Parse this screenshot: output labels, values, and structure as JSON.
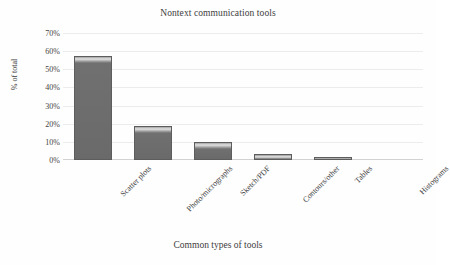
{
  "figure": {
    "title": "Nontext communication tools",
    "xlabel": "Common types of tools",
    "ylabel": "% of total"
  },
  "axis": {
    "yticks": [
      "70%",
      "60%",
      "50%",
      "40%",
      "30%",
      "20%",
      "10%",
      "0%"
    ]
  },
  "chart_data": {
    "type": "bar",
    "title": "Nontext communication tools",
    "xlabel": "Common types of tools",
    "ylabel": "% of total",
    "categories": [
      "Scatter plots",
      "Photo/micrographs",
      "Sketch/PDF",
      "Contours/other",
      "Tables",
      "Histograms"
    ],
    "values": [
      58,
      19,
      10,
      3.5,
      1,
      0
    ],
    "value_unit": "percent",
    "ylim": [
      0,
      70
    ],
    "ytick_step": 10,
    "ytick_labels": [
      "0%",
      "10%",
      "20%",
      "30%",
      "40%",
      "50%",
      "60%",
      "70%"
    ],
    "grid": "horizontal",
    "legend": "none",
    "bar_color": "#6a6a6a",
    "bar_edge_color": "#5d5d5d",
    "gridline_color": "#ececec",
    "background_color": "#fefefe",
    "xtick_rotation_deg": -45
  }
}
